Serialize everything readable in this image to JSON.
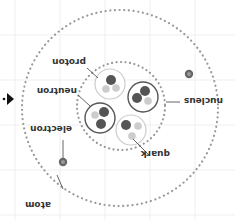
{
  "diagram": {
    "orientation": "rotated-180",
    "labels": {
      "atom": "atom",
      "electron": "electron",
      "nucleus": "nucleus",
      "proton": "proton",
      "neutron": "neutron",
      "quark": "quark"
    },
    "quark_labels": {
      "up": "p",
      "down": "n",
      "electron_mark": "e"
    },
    "colors": {
      "dots": "#999999",
      "grid": "#eeeeee",
      "proton_ring": "#555555",
      "neutron_ring": "#cccccc",
      "dark_quark": "#555555",
      "light_quark": "#bbbbbb",
      "label": "#333333",
      "arrow": "#111111"
    }
  }
}
